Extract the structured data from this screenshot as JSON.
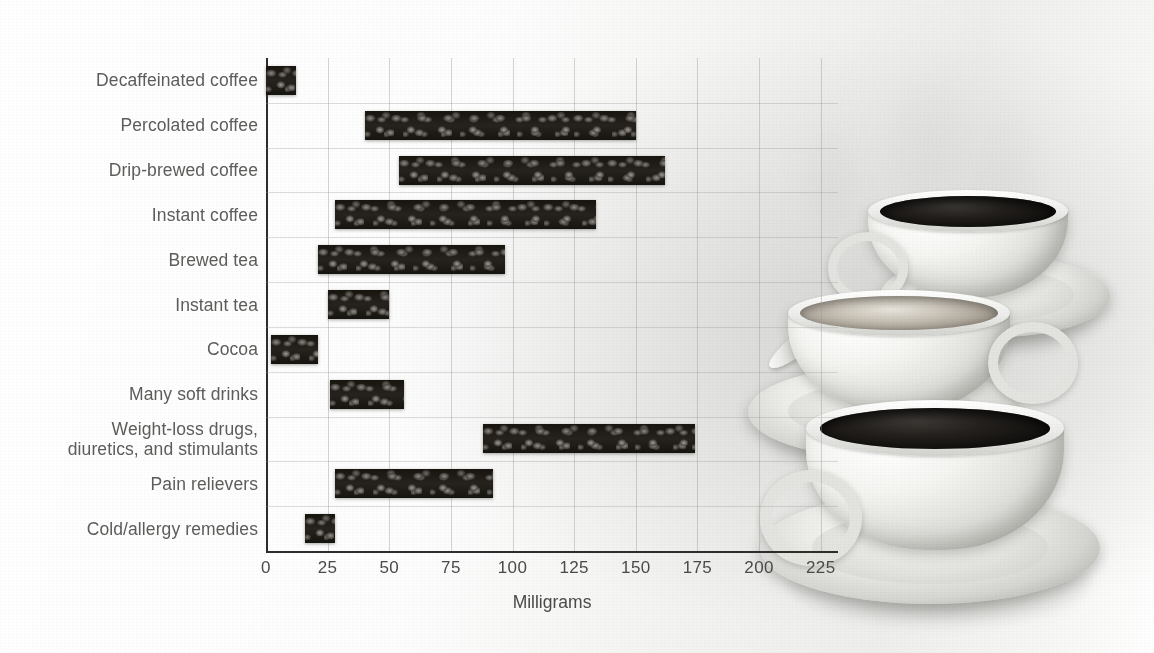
{
  "chart_data": {
    "type": "bar",
    "orientation": "horizontal",
    "title": "",
    "xlabel": "Milligrams",
    "ylabel": "",
    "xlim": [
      0,
      232
    ],
    "xticks": [
      0,
      25,
      50,
      75,
      100,
      125,
      150,
      175,
      200,
      225
    ],
    "xtick_labels": [
      "0",
      "25",
      "50",
      "75",
      "100",
      "125",
      "150",
      "175",
      "200",
      "225"
    ],
    "grid": true,
    "legend": null,
    "note": "Each bar is a floating range bar (low-high caffeine content).",
    "categories": [
      "Decaffeinated coffee",
      "Percolated coffee",
      "Drip-brewed coffee",
      "Instant coffee",
      "Brewed tea",
      "Instant tea",
      "Cocoa",
      "Many soft drinks",
      "Weight-loss drugs, diuretics, and stimulants",
      "Pain relievers",
      "Cold/allergy remedies"
    ],
    "bars": [
      {
        "category": "Decaffeinated coffee",
        "label_lines": [
          "Decaffeinated coffee"
        ],
        "low": 0,
        "high": 12
      },
      {
        "category": "Percolated coffee",
        "label_lines": [
          "Percolated coffee"
        ],
        "low": 40,
        "high": 150
      },
      {
        "category": "Drip-brewed coffee",
        "label_lines": [
          "Drip-brewed coffee"
        ],
        "low": 54,
        "high": 162
      },
      {
        "category": "Instant coffee",
        "label_lines": [
          "Instant coffee"
        ],
        "low": 28,
        "high": 134
      },
      {
        "category": "Brewed tea",
        "label_lines": [
          "Brewed tea"
        ],
        "low": 21,
        "high": 97
      },
      {
        "category": "Instant tea",
        "label_lines": [
          "Instant tea"
        ],
        "low": 25,
        "high": 50
      },
      {
        "category": "Cocoa",
        "label_lines": [
          "Cocoa"
        ],
        "low": 2,
        "high": 21
      },
      {
        "category": "Many soft drinks",
        "label_lines": [
          "Many soft drinks"
        ],
        "low": 26,
        "high": 56
      },
      {
        "category": "Weight-loss drugs, diuretics, and stimulants",
        "label_lines": [
          "Weight-loss drugs,",
          "diuretics, and stimulants"
        ],
        "low": 88,
        "high": 174
      },
      {
        "category": "Pain relievers",
        "label_lines": [
          "Pain relievers"
        ],
        "low": 28,
        "high": 92
      },
      {
        "category": "Cold/allergy remedies",
        "label_lines": [
          "Cold/allergy remedies"
        ],
        "low": 16,
        "high": 28
      }
    ]
  },
  "photo": {
    "subject": "three stacked coffee cups with saucers and spoon",
    "style": "grayscale photograph"
  },
  "colors": {
    "bar_fill": "#1d1b19",
    "axis": "#2d2d2d",
    "grid": "#969694",
    "label_text": "#5c5c5a",
    "tick_text": "#4a4a48",
    "background": "#ffffff"
  }
}
